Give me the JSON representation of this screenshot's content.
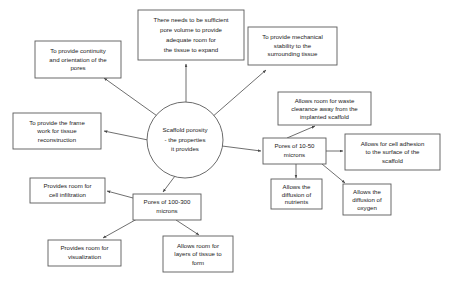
{
  "diagram": {
    "background_color": "#ffffff",
    "box_stroke_color": "#5a5a5a",
    "connector_color": "#4a4a4a",
    "text_color": "#1a1a1a",
    "center": {
      "id": "scaffold-porosity",
      "lines": [
        "Scaffold porosity",
        "- the properties",
        "it provides"
      ],
      "shape": "circle"
    },
    "nodes": [
      {
        "id": "continuity-orientation",
        "lines": [
          "To provide continuity",
          "and orientation of the",
          "pores"
        ]
      },
      {
        "id": "pore-volume",
        "lines": [
          "There needs to be sufficient",
          "pore volume to provide",
          "adequate room for",
          "the tissue to expand"
        ]
      },
      {
        "id": "mechanical-stability",
        "lines": [
          "To provide mechanical",
          "stability to the",
          "surrounding tissue"
        ]
      },
      {
        "id": "frame-work",
        "lines": [
          "To provide the frame",
          "work for tissue",
          "reconstruction"
        ]
      },
      {
        "id": "waste-clearance",
        "lines": [
          "Allows room for waste",
          "clearance away from the",
          "implanted scaffold"
        ]
      },
      {
        "id": "pores-10-50",
        "lines": [
          "Pores of 10-50",
          "microns"
        ]
      },
      {
        "id": "cell-adhesion",
        "lines": [
          "Allows for cell adhesion",
          "to the surface of the",
          "scaffold"
        ]
      },
      {
        "id": "diffusion-nutrients",
        "lines": [
          "Allows the",
          "diffusion of",
          "nutrients"
        ]
      },
      {
        "id": "diffusion-oxygen",
        "lines": [
          "Allows the",
          "diffusion of",
          "oxygen"
        ]
      },
      {
        "id": "cell-infiltration",
        "lines": [
          "Provides room for",
          "cell infiltration"
        ]
      },
      {
        "id": "pores-100-300",
        "lines": [
          "Pores of 100-300",
          "microns"
        ]
      },
      {
        "id": "visualization",
        "lines": [
          "Provides room for",
          "visualization"
        ]
      },
      {
        "id": "layers-of-tissue",
        "lines": [
          "Allows room for",
          "layers of tissue to",
          "form"
        ]
      }
    ]
  }
}
